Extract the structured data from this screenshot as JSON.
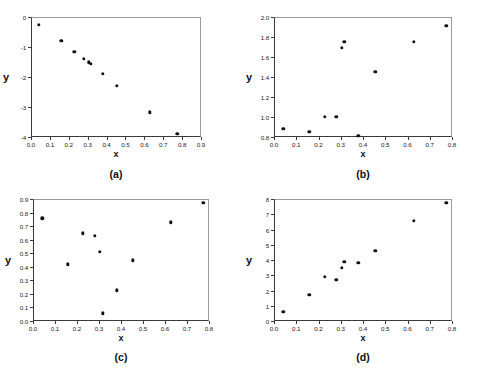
{
  "figure": {
    "panel_count": 4,
    "marker_color": "#111111",
    "frame_color": "#3a3a3a",
    "background": "#ffffff"
  },
  "panels": [
    {
      "key": "a",
      "caption": "(a)",
      "xlabel": "x",
      "ylabel": "y",
      "xticks": [
        "0.0",
        "0.1",
        "0.2",
        "0.3",
        "0.4",
        "0.5",
        "0.6",
        "0.7",
        "0.8",
        "0.9"
      ],
      "yticks": [
        "0",
        "-1",
        "-2",
        "-3",
        "-4"
      ]
    },
    {
      "key": "b",
      "caption": "(b)",
      "xlabel": "x",
      "ylabel": "y",
      "xticks": [
        "0.0",
        "0.1",
        "0.2",
        "0.3",
        "0.4",
        "0.5",
        "0.6",
        "0.7",
        "0.8"
      ],
      "yticks": [
        "0.8",
        "1.0",
        "1.2",
        "1.4",
        "1.6",
        "1.8",
        "2.0"
      ]
    },
    {
      "key": "c",
      "caption": "(c)",
      "xlabel": "x",
      "ylabel": "y",
      "xticks": [
        "0.0",
        "0.1",
        "0.2",
        "0.3",
        "0.4",
        "0.5",
        "0.6",
        "0.7",
        "0.8"
      ],
      "yticks": [
        "0.0",
        "0.1",
        "0.2",
        "0.3",
        "0.4",
        "0.5",
        "0.6",
        "0.7",
        "0.8",
        "0.9"
      ]
    },
    {
      "key": "d",
      "caption": "(d)",
      "xlabel": "x",
      "ylabel": "y",
      "xticks": [
        "0.0",
        "0.1",
        "0.2",
        "0.3",
        "0.4",
        "0.5",
        "0.6",
        "0.7",
        "0.8"
      ],
      "yticks": [
        "0",
        "1",
        "2",
        "3",
        "4",
        "5",
        "6",
        "7",
        "8"
      ]
    }
  ],
  "chart_data": [
    {
      "type": "scatter",
      "title": "(a)",
      "xlabel": "x",
      "ylabel": "y",
      "xlim": [
        0.0,
        0.9
      ],
      "ylim": [
        -4.0,
        0.0
      ],
      "grid": false,
      "legend": null,
      "x": [
        0.037,
        0.155,
        0.223,
        0.275,
        0.3,
        0.312,
        0.375,
        0.45,
        0.623,
        0.77
      ],
      "y": [
        -0.22,
        -0.77,
        -1.12,
        -1.35,
        -1.48,
        -1.52,
        -1.87,
        -2.26,
        -3.14,
        -3.86
      ]
    },
    {
      "type": "scatter",
      "title": "(b)",
      "xlabel": "x",
      "ylabel": "y",
      "xlim": [
        0.0,
        0.8
      ],
      "ylim": [
        0.8,
        2.0
      ],
      "grid": false,
      "legend": null,
      "x": [
        0.037,
        0.155,
        0.223,
        0.275,
        0.3,
        0.312,
        0.375,
        0.45,
        0.623,
        0.77
      ],
      "y": [
        0.89,
        0.86,
        1.01,
        1.015,
        1.7,
        1.76,
        0.82,
        1.46,
        1.76,
        1.92
      ]
    },
    {
      "type": "scatter",
      "title": "(c)",
      "xlabel": "x",
      "ylabel": "y",
      "xlim": [
        0.0,
        0.8
      ],
      "ylim": [
        0.0,
        0.9
      ],
      "grid": false,
      "legend": null,
      "x": [
        0.037,
        0.155,
        0.223,
        0.275,
        0.3,
        0.312,
        0.375,
        0.45,
        0.623,
        0.77
      ],
      "y": [
        0.765,
        0.425,
        0.655,
        0.635,
        0.52,
        0.065,
        0.233,
        0.455,
        0.735,
        0.878
      ]
    },
    {
      "type": "scatter",
      "title": "(d)",
      "xlabel": "x",
      "ylabel": "y",
      "xlim": [
        0.0,
        0.8
      ],
      "ylim": [
        0.0,
        8.0
      ],
      "grid": false,
      "legend": null,
      "x": [
        0.037,
        0.155,
        0.223,
        0.275,
        0.3,
        0.312,
        0.375,
        0.45,
        0.623,
        0.77
      ],
      "y": [
        0.65,
        1.78,
        2.98,
        2.75,
        3.57,
        3.93,
        3.88,
        4.65,
        6.65,
        7.82
      ]
    }
  ]
}
